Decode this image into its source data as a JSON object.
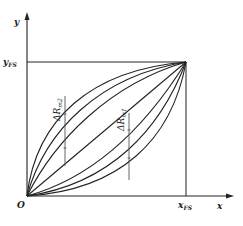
{
  "diagram": {
    "axes": {
      "x_label": "x",
      "y_label": "y",
      "origin_label": "O",
      "x_fs_label": "x",
      "x_fs_sub": "FS",
      "y_fs_label": "y",
      "y_fs_sub": "FS"
    },
    "annotations": [
      {
        "id": "dr2",
        "label": "ΔR",
        "sub": "m2"
      },
      {
        "id": "dr1",
        "label": "ΔR",
        "sub": "m1"
      }
    ],
    "curves": {
      "count": 7,
      "upper_concave": 3,
      "middle_linear": 1,
      "lower_convex": 3,
      "start": "O",
      "end": "(x_FS, y_FS)"
    },
    "colors": {
      "line": "#222222",
      "background": "#ffffff",
      "guide": "#555555"
    }
  }
}
